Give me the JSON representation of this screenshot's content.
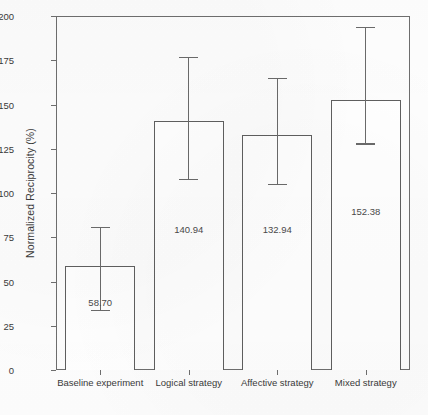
{
  "chart_data": {
    "type": "bar",
    "title": "",
    "xlabel": "",
    "ylabel": "Normalized Reciprocity (%)",
    "ylim": [
      0,
      200
    ],
    "yticks": [
      0,
      25,
      50,
      75,
      100,
      125,
      150,
      175,
      200
    ],
    "ytick_labels": [
      "0",
      "25",
      "50",
      "75",
      "100",
      "125",
      "150",
      "175",
      "200"
    ],
    "grid": false,
    "legend": "none",
    "bar_style": {
      "fill": "#ffffff",
      "edge": "#5f5f5f",
      "errorbar_color": "#6a6a6a"
    },
    "categories": [
      "Baseline experiment",
      "Logical strategy",
      "Affective strategy",
      "Mixed strategy"
    ],
    "values": [
      58.7,
      140.94,
      132.94,
      152.38
    ],
    "value_labels": [
      "58.70",
      "140.94",
      "132.94",
      "152.38"
    ],
    "error_upper": [
      81.0,
      177.0,
      165.0,
      194.0
    ],
    "error_lower": [
      34.0,
      108.0,
      105.0,
      128.0
    ],
    "bars": [
      {
        "category": "Baseline experiment",
        "value": 58.7,
        "label": "58.70",
        "err_top": 81.0,
        "err_bottom": 34.0,
        "label_y": 38.0
      },
      {
        "category": "Logical strategy",
        "value": 140.94,
        "label": "140.94",
        "err_top": 177.0,
        "err_bottom": 108.0,
        "label_y": 79.0
      },
      {
        "category": "Affective strategy",
        "value": 132.94,
        "label": "132.94",
        "err_top": 165.0,
        "err_bottom": 105.0,
        "label_y": 79.0
      },
      {
        "category": "Mixed strategy",
        "value": 152.38,
        "label": "152.38",
        "err_top": 194.0,
        "err_bottom": 128.0,
        "label_y": 89.0
      }
    ]
  }
}
